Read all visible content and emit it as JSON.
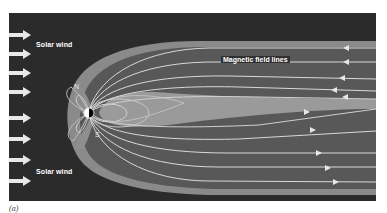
{
  "figure": {
    "caption": "(a)",
    "labels": {
      "solar_wind_top": "Solar wind",
      "solar_wind_bottom": "Solar wind",
      "magnetic_field_lines": "Magnetic field lines",
      "north_pole": "N",
      "south_pole": "S"
    },
    "solar_wind_arrow_count": 8,
    "colors": {
      "background": "#2b2b2b",
      "magnetosheath": "#8a8a8a",
      "magnetosphere": "#5c5c5c",
      "plasma_sheet": "#9a9a9a",
      "field_line": "#d8d8d8",
      "arrow": "#e6e6e6",
      "earth_day": "#ffffff",
      "earth_night": "#000000"
    }
  }
}
